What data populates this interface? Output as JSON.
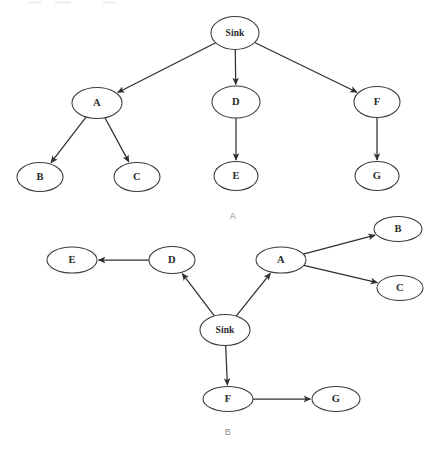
{
  "figure": {
    "background_color": "#ffffff",
    "stroke_color": "#2f2f2f",
    "node_fill": "#ffffff",
    "caption_color": "#8d8d8d",
    "panels": [
      {
        "id": "panel-a",
        "caption": "A",
        "caption_x": 233,
        "caption_y": 217,
        "layout": "tree-downward",
        "nodes": [
          {
            "id": "sink",
            "label": "Sink",
            "cx": 235,
            "cy": 33,
            "rx": 24,
            "ry": 16.5
          },
          {
            "id": "a",
            "label": "A",
            "cx": 97,
            "cy": 103,
            "rx": 25,
            "ry": 15.5
          },
          {
            "id": "d",
            "label": "D",
            "cx": 236,
            "cy": 102,
            "rx": 24,
            "ry": 16
          },
          {
            "id": "f",
            "label": "F",
            "cx": 377,
            "cy": 102,
            "rx": 23,
            "ry": 15.5
          },
          {
            "id": "b",
            "label": "B",
            "cx": 40,
            "cy": 177,
            "rx": 23,
            "ry": 14.5
          },
          {
            "id": "c",
            "label": "C",
            "cx": 137,
            "cy": 177,
            "rx": 23,
            "ry": 14.5
          },
          {
            "id": "e",
            "label": "E",
            "cx": 236,
            "cy": 176,
            "rx": 22,
            "ry": 14.5
          },
          {
            "id": "g",
            "label": "G",
            "cx": 377,
            "cy": 176,
            "rx": 22,
            "ry": 14.5
          }
        ],
        "edges": [
          {
            "from": "sink",
            "to": "a",
            "directed": true
          },
          {
            "from": "sink",
            "to": "d",
            "directed": true
          },
          {
            "from": "sink",
            "to": "f",
            "directed": true
          },
          {
            "from": "a",
            "to": "b",
            "directed": true
          },
          {
            "from": "a",
            "to": "c",
            "directed": true
          },
          {
            "from": "d",
            "to": "e",
            "directed": true
          },
          {
            "from": "f",
            "to": "g",
            "directed": true
          }
        ]
      },
      {
        "id": "panel-b",
        "caption": "B",
        "caption_x": 228,
        "caption_y": 433,
        "layout": "radial-outward",
        "nodes": [
          {
            "id": "sink",
            "label": "Sink",
            "cx": 225,
            "cy": 330,
            "rx": 25,
            "ry": 15.5
          },
          {
            "id": "d",
            "label": "D",
            "cx": 172,
            "cy": 260,
            "rx": 23,
            "ry": 13.5
          },
          {
            "id": "e",
            "label": "E",
            "cx": 72,
            "cy": 260,
            "rx": 25,
            "ry": 13
          },
          {
            "id": "a",
            "label": "A",
            "cx": 281,
            "cy": 260,
            "rx": 25,
            "ry": 13
          },
          {
            "id": "b",
            "label": "B",
            "cx": 398,
            "cy": 229,
            "rx": 24,
            "ry": 12.5
          },
          {
            "id": "c",
            "label": "C",
            "cx": 400,
            "cy": 288,
            "rx": 23,
            "ry": 12.5
          },
          {
            "id": "f",
            "label": "F",
            "cx": 228,
            "cy": 399,
            "rx": 25,
            "ry": 12.5
          },
          {
            "id": "g",
            "label": "G",
            "cx": 336,
            "cy": 399,
            "rx": 24,
            "ry": 12.5
          }
        ],
        "edges": [
          {
            "from": "sink",
            "to": "d",
            "directed": true
          },
          {
            "from": "sink",
            "to": "a",
            "directed": true
          },
          {
            "from": "sink",
            "to": "f",
            "directed": true
          },
          {
            "from": "d",
            "to": "e",
            "directed": true
          },
          {
            "from": "a",
            "to": "b",
            "directed": true
          },
          {
            "from": "a",
            "to": "c",
            "directed": true
          },
          {
            "from": "f",
            "to": "g",
            "directed": true
          }
        ]
      }
    ]
  }
}
